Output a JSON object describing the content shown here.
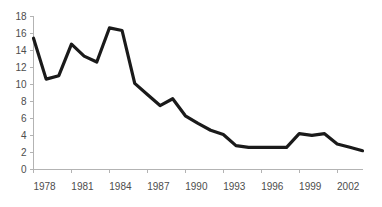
{
  "chart_data": {
    "type": "line",
    "title": "",
    "subtitle": "",
    "xlabel": "",
    "ylabel": "",
    "xlim": [
      1978,
      2004
    ],
    "ylim": [
      0,
      18
    ],
    "grid": false,
    "legend": false,
    "legend_position": "none",
    "line_color": "#1a1a1a",
    "axis_color": "#b3b3b3",
    "label_color": "#4d4d4d",
    "y_ticks": [
      0,
      2,
      4,
      6,
      8,
      10,
      12,
      14,
      16,
      18
    ],
    "y_tick_labels": [
      "0",
      "2",
      "4",
      "6",
      "8",
      "10",
      "12",
      "14",
      "16",
      "18"
    ],
    "x_ticks": [
      1978,
      1981,
      1984,
      1987,
      1990,
      1993,
      1996,
      1999,
      2002
    ],
    "x_tick_labels": [
      "1978",
      "1981",
      "1984",
      "1987",
      "1990",
      "1993",
      "1996",
      "1999",
      "2002"
    ],
    "x": [
      1978,
      1979,
      1980,
      1981,
      1982,
      1983,
      1984,
      1985,
      1986,
      1987,
      1988,
      1989,
      1990,
      1991,
      1992,
      1993,
      1994,
      1995,
      1996,
      1997,
      1998,
      1999,
      2000,
      2001,
      2002,
      2003,
      2004
    ],
    "series": [
      {
        "name": "series-1",
        "color": "#1a1a1a",
        "values": [
          15.4,
          10.6,
          11.0,
          14.7,
          13.3,
          12.6,
          16.6,
          16.3,
          10.1,
          8.8,
          7.5,
          8.3,
          6.3,
          5.4,
          4.6,
          4.1,
          2.8,
          2.6,
          2.6,
          2.6,
          2.6,
          4.2,
          4.0,
          4.2,
          3.0,
          2.6,
          2.2
        ]
      }
    ]
  }
}
